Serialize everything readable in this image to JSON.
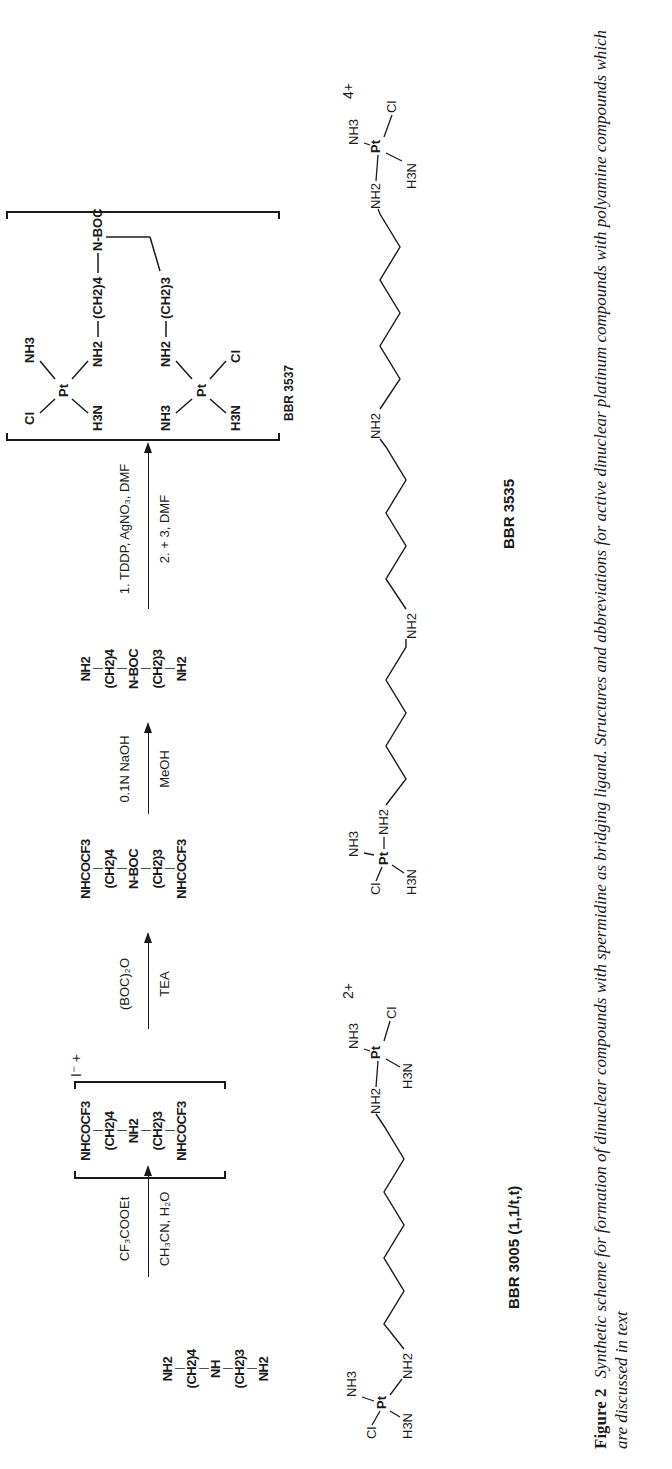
{
  "scheme": {
    "compounds": [
      {
        "id": "spermidine",
        "rows": [
          "NH2",
          "(CH2)4",
          "NH",
          "(CH2)3",
          "NH2"
        ]
      },
      {
        "id": "trifluoroacetamide-salt",
        "rows": [
          "NHCOCF3",
          "(CH2)4",
          "NH2",
          "(CH2)3",
          "NHCOCF3"
        ],
        "charge": "I⁻ +"
      },
      {
        "id": "boc-protected",
        "rows": [
          "NHCOCF3",
          "(CH2)4",
          "N-BOC",
          "(CH2)3",
          "NHCOCF3"
        ]
      },
      {
        "id": "boc-diamine",
        "rows": [
          "NH2",
          "(CH2)4",
          "N-BOC",
          "(CH2)3",
          "NH2"
        ]
      }
    ],
    "steps": [
      {
        "above": "CF₃COOEt",
        "below": "CH₃CN, H₂O"
      },
      {
        "above": "(BOC)₂O",
        "below": "TEA"
      },
      {
        "above": "0.1N NaOH",
        "below": "MeOH"
      },
      {
        "above": "1. TDDP, AgNO₃, DMF",
        "below": "2. + 3, DMF"
      },
      {
        "above": "MeOH, H₂O, HCl",
        "below": ""
      }
    ],
    "complexes": [
      {
        "label": "BBR 3537",
        "charge": "2+",
        "bridge": [
          "NH2",
          "(CH2)4",
          "N-BOC",
          "(CH2)3",
          "NH2"
        ],
        "ligands": {
          "left_top": "Cl",
          "left_bottom": "H3N",
          "right_top": "NH3",
          "right_bottom": "Cl"
        }
      },
      {
        "label": "BBR 3571",
        "charge": "3+",
        "bridge": [
          "NH2",
          "(CH2)4",
          "NH2",
          "(CH2)3",
          "NH2"
        ],
        "ligands": {
          "left_top": "Cl",
          "left_bottom": "H3N",
          "right_top": "NH3",
          "right_bottom": "Cl"
        }
      }
    ]
  },
  "structures": [
    {
      "label": "BBR 3005   (1,1/t,t)",
      "charge": "2+"
    },
    {
      "label": "BBR 3535",
      "charge": "4+"
    }
  ],
  "caption": {
    "figure_number": "Figure 2",
    "text": "Synthetic scheme for formation of dinuclear compounds with spermidine as bridging ligand. Structures and abbreviations for active dinuclear platinum compounds with polyamine compounds which are discussed in text"
  }
}
